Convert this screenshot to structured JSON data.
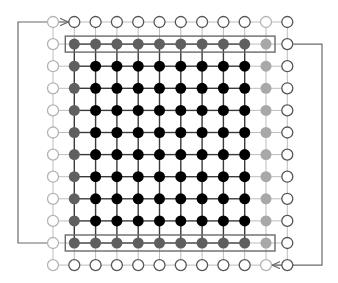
{
  "diagram": {
    "grid": {
      "cols": 12,
      "rows": 12,
      "x0": 53,
      "y0": 22,
      "dx": 21.3,
      "dy": 22.1,
      "node_radius": 5.5
    },
    "colors": {
      "interior": "#000000",
      "boundary": "#5f5f5f",
      "edge_boundary": "#a8a8a8",
      "ghost_dark": "#555555",
      "ghost_light": "#b4b4b4",
      "line_dark": "#3a3a3a",
      "line_light": "#bdbdbd",
      "box": "#6a6a6a",
      "arrow": "#6a6a6a"
    },
    "node_types_legend": {
      "I": "interior (black filled)",
      "B": "boundary row/col (dark gray filled)",
      "E": "right edge (light gray filled)",
      "G": "ghost (dark hollow)",
      "L": "ghost (light hollow)"
    },
    "layout": [
      "LGGGGGGGGGLG",
      "LBBBBBBBBBEG",
      "LBIIIIIIIIEG",
      "LBIIIIIIIIEG",
      "LBIIIIIIIIEG",
      "LBIIIIIIIIEG",
      "LBIIIIIIIIEG",
      "LBIIIIIIIIEG",
      "LBIIIIIIIIEG",
      "LBIIIIIIIIEG",
      "LBBBBBBBBBEG",
      "LGGGGGGGGGLG"
    ],
    "highlight_boxes": [
      {
        "name": "top-boundary-row-box",
        "row": 1,
        "col_start": 1,
        "col_end": 10
      },
      {
        "name": "bottom-boundary-row-box",
        "row": 10,
        "col_start": 1,
        "col_end": 10
      }
    ],
    "arrows": [
      {
        "name": "left-wrap-arrow",
        "from_row": 10,
        "to_row": 0,
        "side": "left",
        "x": 18,
        "to_col": 1
      },
      {
        "name": "right-wrap-arrow",
        "from_row": 1,
        "to_row": 11,
        "side": "right",
        "x": 322,
        "to_col": 10
      }
    ]
  }
}
